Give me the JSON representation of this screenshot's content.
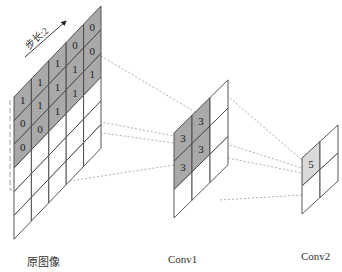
{
  "labels": {
    "original": "原图像",
    "conv1": "Conv1",
    "conv2": "Conv2",
    "stride": "步长:2"
  },
  "colors": {
    "shade_dark": "#a9a9a9",
    "shade_light": "#d9d9d9",
    "line": "#444444",
    "dashed": "#9a9a9a"
  },
  "original_grid": {
    "cols": 5,
    "rows": 6,
    "values": [
      [
        "1",
        "1",
        "1",
        "0",
        "0"
      ],
      [
        "0",
        "1",
        "1",
        "1",
        "0"
      ],
      [
        "0",
        "0",
        "1",
        "1",
        "1"
      ],
      [
        "",
        "",
        "",
        "",
        ""
      ],
      [
        "",
        "",
        "",
        "",
        ""
      ],
      [
        "",
        "",
        "",
        "",
        ""
      ]
    ],
    "shaded_rows": 3
  },
  "conv1_grid": {
    "cols": 3,
    "rows": 3,
    "values": [
      [
        "3",
        "3",
        ""
      ],
      [
        "3",
        "3",
        ""
      ],
      [
        "",
        "",
        ""
      ]
    ]
  },
  "conv2_grid": {
    "cols": 2,
    "rows": 2,
    "values": [
      [
        "5",
        ""
      ],
      [
        "",
        ""
      ]
    ]
  }
}
